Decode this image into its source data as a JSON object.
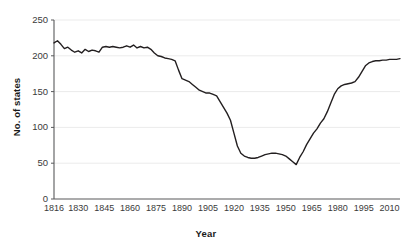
{
  "chart_data": {
    "type": "line",
    "title": "",
    "xlabel": "Year",
    "ylabel": "No. of states",
    "xlim": [
      1816,
      2016
    ],
    "ylim": [
      0,
      250
    ],
    "grid": true,
    "legend": false,
    "xticks": [
      1816,
      1830,
      1845,
      1860,
      1875,
      1890,
      1905,
      1920,
      1935,
      1950,
      1965,
      1980,
      1995,
      2010
    ],
    "xtick_labels": [
      "1816",
      "1830",
      "1845",
      "1860",
      "1875",
      "1890",
      "1905",
      "1920",
      "1935",
      "1950",
      "1965",
      "1980",
      "1995",
      "2010"
    ],
    "yticks": [
      0,
      50,
      100,
      150,
      200,
      250
    ],
    "ytick_labels": [
      "0",
      "50",
      "100",
      "150",
      "200",
      "250"
    ],
    "line_color": "#231f20",
    "line_width": 1.4,
    "series": [
      {
        "name": "No. of states",
        "x": [
          1816,
          1818,
          1820,
          1822,
          1824,
          1826,
          1828,
          1830,
          1832,
          1834,
          1836,
          1838,
          1840,
          1842,
          1844,
          1846,
          1848,
          1850,
          1852,
          1854,
          1856,
          1858,
          1860,
          1862,
          1864,
          1866,
          1868,
          1870,
          1872,
          1874,
          1876,
          1878,
          1880,
          1882,
          1884,
          1886,
          1888,
          1890,
          1892,
          1894,
          1896,
          1898,
          1900,
          1902,
          1904,
          1906,
          1908,
          1910,
          1912,
          1914,
          1916,
          1918,
          1920,
          1922,
          1924,
          1926,
          1928,
          1930,
          1932,
          1934,
          1936,
          1938,
          1940,
          1942,
          1944,
          1946,
          1948,
          1950,
          1952,
          1954,
          1956,
          1958,
          1960,
          1962,
          1964,
          1966,
          1968,
          1970,
          1972,
          1974,
          1976,
          1978,
          1980,
          1982,
          1984,
          1986,
          1988,
          1990,
          1992,
          1994,
          1996,
          1998,
          2000,
          2002,
          2004,
          2006,
          2008,
          2010,
          2012,
          2014,
          2016
        ],
        "values": [
          218,
          221,
          216,
          210,
          212,
          208,
          205,
          207,
          204,
          209,
          206,
          208,
          207,
          205,
          212,
          213,
          212,
          213,
          212,
          211,
          212,
          214,
          212,
          215,
          211,
          213,
          211,
          212,
          209,
          204,
          200,
          199,
          197,
          196,
          195,
          193,
          180,
          168,
          166,
          164,
          160,
          156,
          152,
          150,
          148,
          148,
          146,
          144,
          136,
          128,
          120,
          110,
          92,
          74,
          64,
          60,
          58,
          57,
          57,
          58,
          60,
          62,
          63,
          64,
          64,
          63,
          62,
          60,
          56,
          52,
          48,
          58,
          66,
          76,
          84,
          92,
          98,
          106,
          112,
          122,
          134,
          146,
          154,
          158,
          160,
          161,
          162,
          164,
          170,
          178,
          186,
          190,
          192,
          193,
          193,
          194,
          194,
          195,
          195,
          195,
          196
        ]
      }
    ]
  }
}
